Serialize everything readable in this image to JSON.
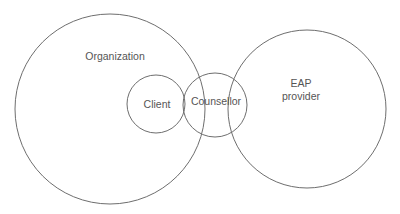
{
  "diagram": {
    "type": "venn-relationship",
    "stroke_color": "#6e6e6e",
    "text_color": "#555555",
    "background": "#ffffff",
    "circles": [
      {
        "id": "organization",
        "label": "Organization",
        "cx": 110,
        "cy": 109,
        "r": 95,
        "label_x": 115,
        "label_y": 56
      },
      {
        "id": "client",
        "label": "Client",
        "cx": 156,
        "cy": 104,
        "r": 29,
        "label_x": 157,
        "label_y": 104
      },
      {
        "id": "counsellor",
        "label": "Counsellor",
        "cx": 215,
        "cy": 105,
        "r": 32,
        "label_x": 216,
        "label_y": 101
      },
      {
        "id": "eap-provider",
        "label_line1": "EAP",
        "label_line2": "provider",
        "cx": 307,
        "cy": 109,
        "r": 79,
        "label_x": 301,
        "label_y": 90
      }
    ]
  }
}
